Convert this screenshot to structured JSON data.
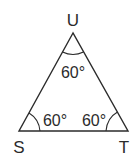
{
  "diagram": {
    "type": "triangle",
    "vertices": [
      {
        "name": "U",
        "label": "U"
      },
      {
        "name": "S",
        "label": "S"
      },
      {
        "name": "T",
        "label": "T"
      }
    ],
    "angles": [
      {
        "vertex": "U",
        "label": "60°"
      },
      {
        "vertex": "S",
        "label": "60°"
      },
      {
        "vertex": "T",
        "label": "60°"
      }
    ],
    "colors": {
      "stroke": "#2b2b2b",
      "background": "#ffffff"
    }
  }
}
